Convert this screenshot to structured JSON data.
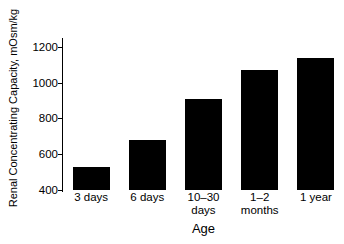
{
  "chart_data": {
    "type": "bar",
    "title": "",
    "xlabel": "Age",
    "ylabel": "Renal Concentrating Capacity, mOsm/kg",
    "categories": [
      "3 days",
      "6 days",
      "10–30\ndays",
      "1–2\nmonths",
      "1 year"
    ],
    "values": [
      530,
      680,
      910,
      1070,
      1140
    ],
    "ylim": [
      400,
      1250
    ],
    "yticks": [
      400,
      600,
      800,
      1000,
      1200
    ],
    "ytick_labels": [
      "400",
      "600",
      "800",
      "1000",
      "1200"
    ],
    "grid": false,
    "legend": false,
    "bar_color": "#000000",
    "background_color": "#ffffff",
    "axis_color": "#000000"
  }
}
